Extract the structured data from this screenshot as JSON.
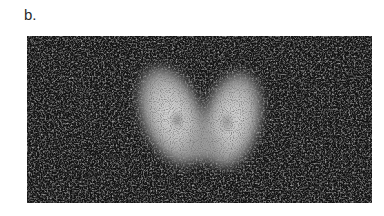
{
  "figure": {
    "panel_label": "b.",
    "image": {
      "subject": "thyroid-scintigraphy-scan",
      "description": "Grayscale nuclear medicine scan showing two bright thyroid lobes on a dark noisy background",
      "colors": {
        "background": "#111111",
        "lobe_core": "#d8d8d8",
        "lobe_edge": "#7a7a7a",
        "noise": "#5a5a5a"
      },
      "lobes": [
        {
          "name": "left-lobe",
          "cx": 145,
          "cy": 80,
          "rx": 30,
          "ry": 52,
          "rotate": -22
        },
        {
          "name": "right-lobe",
          "cx": 205,
          "cy": 84,
          "rx": 28,
          "ry": 50,
          "rotate": 14
        }
      ]
    }
  }
}
